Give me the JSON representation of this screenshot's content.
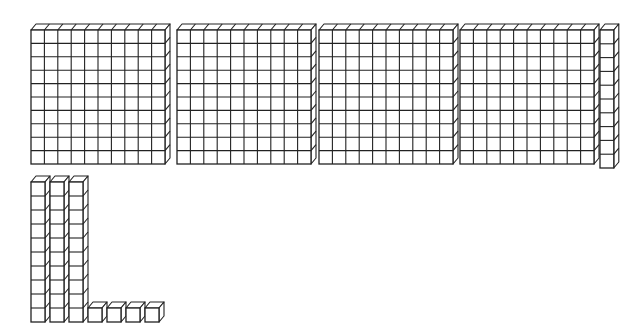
{
  "title": "Base-ten blocks representing 444",
  "colors": {
    "background": "#ffffff",
    "stroke": "#222222",
    "face": "#ffffff"
  },
  "summary": {
    "hundreds": 4,
    "tens": 4,
    "ones": 4,
    "total": 444
  },
  "blocks": {
    "flats": [
      {
        "x": 31,
        "y": 30,
        "cols": 10,
        "rows": 10,
        "cell": 13.4
      },
      {
        "x": 177,
        "y": 30,
        "cols": 10,
        "rows": 10,
        "cell": 13.4
      },
      {
        "x": 319,
        "y": 30,
        "cols": 10,
        "rows": 10,
        "cell": 13.4
      },
      {
        "x": 460,
        "y": 30,
        "cols": 10,
        "rows": 10,
        "cell": 13.4
      }
    ],
    "rods": [
      {
        "x": 600,
        "y": 30,
        "rows": 10,
        "cell": 13.8
      },
      {
        "x": 31,
        "y": 182,
        "rows": 10,
        "cell": 14.0
      },
      {
        "x": 50,
        "y": 182,
        "rows": 10,
        "cell": 14.0
      },
      {
        "x": 69,
        "y": 182,
        "rows": 10,
        "cell": 14.0
      }
    ],
    "units": [
      {
        "x": 88,
        "y": 308,
        "cell": 14.0
      },
      {
        "x": 107,
        "y": 308,
        "cell": 14.0
      },
      {
        "x": 126,
        "y": 308,
        "cell": 14.0
      },
      {
        "x": 145,
        "y": 308,
        "cell": 14.0
      }
    ],
    "depth": {
      "dx": 5,
      "dy": 6
    }
  }
}
